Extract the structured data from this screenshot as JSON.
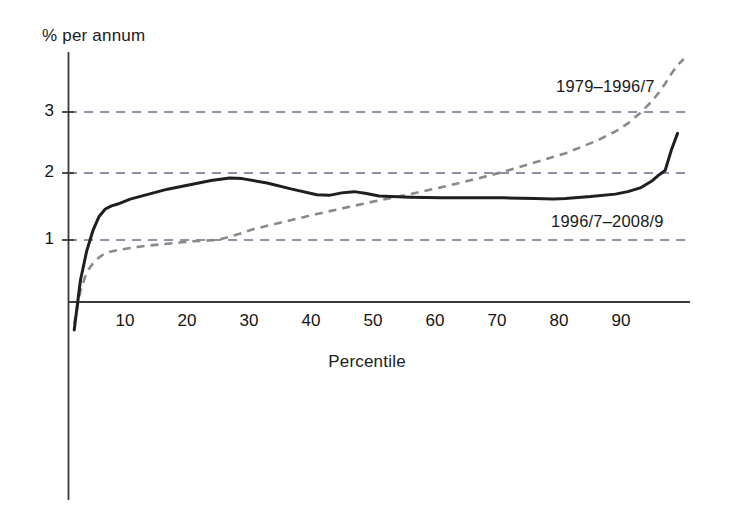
{
  "chart_data": {
    "type": "line",
    "title": "",
    "xlabel": "Percentile",
    "ylabel": "% per annum",
    "xlim": [
      0,
      100
    ],
    "ylim": [
      -0.6,
      4.0
    ],
    "xticks": [
      10,
      20,
      30,
      40,
      50,
      60,
      70,
      80,
      90
    ],
    "yticks": [
      1,
      2,
      3
    ],
    "grid": "horizontal-dashed",
    "legend_position": "inline-annotation",
    "series": [
      {
        "name": "1979–1996/7",
        "style": "dashed",
        "color": "#8a8a8a",
        "x": [
          1,
          2,
          3,
          4,
          5,
          6,
          8,
          10,
          12,
          15,
          18,
          20,
          24,
          26,
          30,
          35,
          40,
          45,
          50,
          55,
          60,
          65,
          70,
          75,
          80,
          85,
          88,
          90,
          92,
          94,
          95,
          96,
          97,
          98,
          99
        ],
        "y": [
          -0.35,
          0.18,
          0.48,
          0.62,
          0.72,
          0.79,
          0.84,
          0.87,
          0.9,
          0.93,
          0.96,
          0.98,
          1.0,
          1.05,
          1.18,
          1.3,
          1.42,
          1.53,
          1.64,
          1.74,
          1.85,
          1.97,
          2.1,
          2.25,
          2.4,
          2.6,
          2.75,
          2.88,
          3.05,
          3.25,
          3.38,
          3.52,
          3.68,
          3.82,
          3.92
        ]
      },
      {
        "name": "1996/7–2008/9",
        "style": "solid",
        "color": "#1f1f1f",
        "x": [
          1,
          2,
          3,
          4,
          5,
          6,
          7,
          8,
          10,
          13,
          16,
          20,
          23,
          26,
          28,
          32,
          36,
          40,
          42,
          44,
          46,
          48,
          50,
          55,
          60,
          65,
          70,
          75,
          78,
          80,
          84,
          88,
          90,
          92,
          94,
          95,
          96,
          97,
          98
        ],
        "y": [
          -0.45,
          0.35,
          0.82,
          1.15,
          1.38,
          1.5,
          1.55,
          1.58,
          1.66,
          1.74,
          1.82,
          1.9,
          1.96,
          2.0,
          1.99,
          1.92,
          1.82,
          1.73,
          1.72,
          1.76,
          1.78,
          1.75,
          1.71,
          1.69,
          1.68,
          1.68,
          1.68,
          1.67,
          1.66,
          1.67,
          1.7,
          1.74,
          1.78,
          1.84,
          1.96,
          2.05,
          2.12,
          2.45,
          2.72
        ]
      }
    ]
  },
  "axes": {
    "y_label": "% per annum",
    "x_label": "Percentile",
    "y_ticks": [
      "1",
      "2",
      "3"
    ],
    "x_ticks": [
      "10",
      "20",
      "30",
      "40",
      "50",
      "60",
      "70",
      "80",
      "90"
    ]
  },
  "annotations": {
    "series_0_label": "1979–1996/7",
    "series_1_label": "1996/7–2008/9"
  },
  "colors": {
    "solid_series": "#1f1f1f",
    "dashed_series": "#8a8a8a",
    "axis": "#3a3a3a",
    "gridline": "#6b6b8a",
    "background": "#ffffff"
  }
}
